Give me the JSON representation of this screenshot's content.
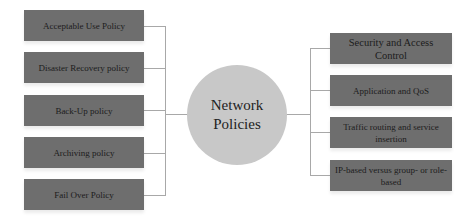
{
  "diagram": {
    "hub": {
      "label_line1": "Network",
      "label_line2": "Policies"
    },
    "left_nodes": [
      {
        "label": "Acceptable Use Policy"
      },
      {
        "label": "Disaster Recovery policy"
      },
      {
        "label": "Back-Up policy"
      },
      {
        "label": "Archiving policy"
      },
      {
        "label": "Fail Over Policy"
      }
    ],
    "right_nodes": [
      {
        "label": "Security and Access Control"
      },
      {
        "label": "Application and QoS"
      },
      {
        "label": "Traffic routing and service insertion"
      },
      {
        "label": "IP-based versus group- or role-based"
      }
    ],
    "colors": {
      "node_fill": "#6e6e6e",
      "hub_fill": "#c8c8c8",
      "connector": "#a8a8a8"
    }
  }
}
